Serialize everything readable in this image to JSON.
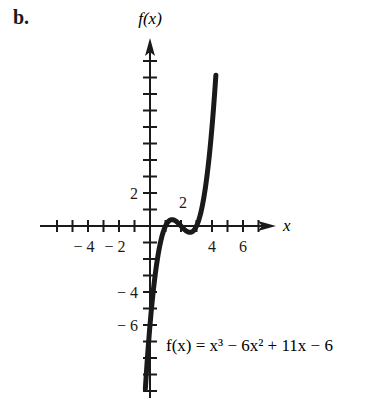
{
  "part_label": "b.",
  "chart_data": {
    "type": "line",
    "title": "",
    "xlabel": "x",
    "ylabel": "f(x)",
    "equation": "f(x) = x³ − 6x² + 11x − 6",
    "function": "x^3 - 6x^2 + 11x - 6",
    "x_tick_labels": [
      "-4",
      "-2",
      "4",
      "6"
    ],
    "x_tick_label_values": [
      -4,
      -2,
      4,
      6
    ],
    "x_tick_label_above": {
      "label": "2",
      "value": 2
    },
    "y_tick_labels": [
      "2",
      "-4",
      "-6"
    ],
    "y_tick_label_values": [
      2,
      -4,
      -6
    ],
    "x_ticks": [
      -6,
      -5,
      -4,
      -3,
      -2,
      -1,
      1,
      2,
      3,
      4,
      5,
      6,
      7
    ],
    "y_ticks": [
      -10,
      -9,
      -8,
      -7,
      -6,
      -5,
      -4,
      -3,
      -2,
      -1,
      1,
      2,
      3,
      4,
      5,
      6,
      7,
      8,
      9,
      10
    ],
    "xlim": [
      -7,
      8
    ],
    "ylim": [
      -11,
      12
    ],
    "x_domain": [
      -0.3,
      4.25
    ],
    "sample_points": [
      {
        "x": -0.3,
        "y": -9.87
      },
      {
        "x": 0,
        "y": -6
      },
      {
        "x": 0.5,
        "y": -1.88
      },
      {
        "x": 1,
        "y": 0
      },
      {
        "x": 1.42,
        "y": 0.38
      },
      {
        "x": 2,
        "y": 0
      },
      {
        "x": 2.58,
        "y": -0.38
      },
      {
        "x": 3,
        "y": 0
      },
      {
        "x": 3.5,
        "y": 1.88
      },
      {
        "x": 4,
        "y": 6
      },
      {
        "x": 4.25,
        "y": 9.14
      }
    ],
    "roots": [
      1,
      2,
      3
    ],
    "grid": false,
    "legend": null
  },
  "style": {
    "curve_color": "#1a1a1a",
    "axis_color": "#1a1a1a"
  }
}
